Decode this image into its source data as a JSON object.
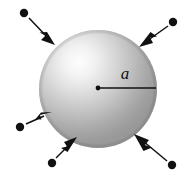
{
  "figure": {
    "kind": "physics-diagram",
    "canvas": {
      "width": 193,
      "height": 183,
      "background": "#ffffff"
    }
  },
  "sphere": {
    "name": "shaded-sphere",
    "center": {
      "x": 98,
      "y": 89
    },
    "radius": 59,
    "highlight": {
      "x_pct": 34,
      "y_pct": 27
    },
    "colors": {
      "highlight": "#fbfbfb",
      "midtone": "#d2d2d2",
      "shadow": "#9c9c9c",
      "edge": "#8e8e8e"
    }
  },
  "radius_indicator": {
    "name": "radius-line",
    "label": "a",
    "label_position": {
      "x": 125,
      "y": 79
    },
    "center_dot": {
      "x": 98,
      "y": 88,
      "r": 2.4
    },
    "line": {
      "x1": 98,
      "y1": 88,
      "x2": 156,
      "y2": 88
    },
    "color": "#111111"
  },
  "arrows": [
    {
      "name": "arrow-top-left",
      "dot": {
        "x": 24,
        "y": 13,
        "r": 4.2
      },
      "tail": {
        "x": 29,
        "y": 18
      },
      "tip": {
        "x": 55,
        "y": 45
      }
    },
    {
      "name": "arrow-top-right",
      "dot": {
        "x": 173,
        "y": 22,
        "r": 4.2
      },
      "tail": {
        "x": 168,
        "y": 27
      },
      "tip": {
        "x": 140,
        "y": 47
      }
    },
    {
      "name": "arrow-left",
      "dot": {
        "x": 20,
        "y": 127,
        "r": 4.2
      },
      "tail": {
        "x": 26,
        "y": 124
      },
      "tip": {
        "x": 51,
        "y": 112
      }
    },
    {
      "name": "arrow-bottom-left",
      "dot": {
        "x": 52,
        "y": 163,
        "r": 4.2
      },
      "tail": {
        "x": 56,
        "y": 158
      },
      "tip": {
        "x": 76,
        "y": 138
      }
    },
    {
      "name": "arrow-bottom-right",
      "dot": {
        "x": 172,
        "y": 165,
        "r": 4.2
      },
      "tail": {
        "x": 167,
        "y": 161
      },
      "tip": {
        "x": 135,
        "y": 134
      }
    }
  ],
  "arrow_style": {
    "color": "#111111",
    "shaft_width": 1.4,
    "head_length": 16,
    "head_half_width": 5.5,
    "head_notch": 4.5
  }
}
